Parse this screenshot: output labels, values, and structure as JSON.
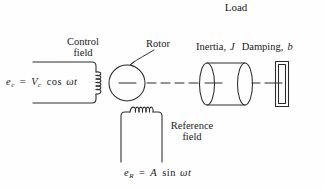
{
  "figure": {
    "type": "two-phase-ac-servomotor-schematic",
    "width": 324,
    "height": 188,
    "background_color": "#fefefe",
    "line_color": "#2a2a2a",
    "text_color": "#1a1a1a"
  },
  "labels": {
    "load": "Load",
    "control_field_line1": "Control",
    "control_field_line2": "field",
    "rotor": "Rotor",
    "inertia_damping": "Inertia, J  Damping, b",
    "inertia_text": "Inertia,",
    "inertia_symbol": "J",
    "damping_text": "Damping,",
    "damping_symbol": "b",
    "reference_field_line1": "Reference",
    "reference_field_line2": "field"
  },
  "equations": {
    "control": {
      "full": "e_c = V_c cos ωt",
      "lhs_base": "e",
      "lhs_sub": "c",
      "equals": "=",
      "amplitude_base": "V",
      "amplitude_sub": "c",
      "function": "cos",
      "argument": "ωt"
    },
    "reference": {
      "full": "e_R = A sin ωt",
      "lhs_base": "e",
      "lhs_sub": "R",
      "equals": "=",
      "amplitude": "A",
      "function": "sin",
      "argument": "ωt"
    }
  },
  "components": {
    "control_field_winding": {
      "name": "control-field-winding",
      "coil_orientation": "vertical",
      "coil_turns": 3,
      "terminals": "open-left"
    },
    "rotor": {
      "name": "rotor",
      "shape": "circle",
      "center_x": 127,
      "center_y": 83,
      "radius": 18
    },
    "shaft": {
      "name": "shaft",
      "style": "dash-dot-centerline"
    },
    "inertia_cylinder": {
      "name": "inertia-load-cylinder",
      "shape": "cylinder",
      "left_x": 202,
      "right_x": 250,
      "top_y": 63,
      "bottom_y": 105
    },
    "load_block": {
      "name": "load-block",
      "shape": "double-outline-rectangle",
      "left_x": 276,
      "right_x": 288,
      "top_y": 62,
      "bottom_y": 106
    },
    "reference_field_winding": {
      "name": "reference-field-winding",
      "coil_orientation": "horizontal",
      "coil_turns": 3,
      "terminals": "open-bottom"
    }
  }
}
